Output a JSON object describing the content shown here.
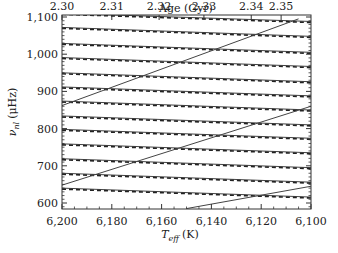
{
  "chart_data": {
    "type": "line",
    "title": "",
    "xlabel": "T_eff (K)",
    "xlabel_main": "T",
    "xlabel_sub": "eff",
    "xlabel_unit": "(K)",
    "ylabel": "ν_nl (μHz)",
    "ylabel_main": "ν",
    "ylabel_sub": "nl",
    "ylabel_unit": "(μHz)",
    "top_xlabel": "Age (Gyr)",
    "xlim": [
      6200,
      6100
    ],
    "ylim": [
      585,
      1110
    ],
    "x_ticks": [
      6200,
      6180,
      6160,
      6140,
      6120,
      6100
    ],
    "x_tick_labels": [
      "6,200",
      "6,180",
      "6,160",
      "6,140",
      "6,120",
      "6,100"
    ],
    "y_ticks": [
      600,
      700,
      800,
      900,
      1000,
      1100
    ],
    "y_tick_labels": [
      "600",
      "700",
      "800",
      "900",
      "1,000",
      "1,100"
    ],
    "top_ticks": [
      {
        "label": "2.30",
        "teff": 6200
      },
      {
        "label": "2.31",
        "teff": 6180
      },
      {
        "label": "2.32",
        "teff": 6161
      },
      {
        "label": "2.33",
        "teff": 6143
      },
      {
        "label": "2.34",
        "teff": 6124
      },
      {
        "label": "2.35",
        "teff": 6112
      }
    ],
    "grid": false,
    "legend": null,
    "series": [
      {
        "name": "radial modes (dashed)",
        "style": "dashed",
        "lines": [
          {
            "x": [
              6200,
              6100
            ],
            "y": [
              1110,
              1088
            ]
          },
          {
            "x": [
              6200,
              6100
            ],
            "y": [
              1072,
              1048
            ]
          },
          {
            "x": [
              6200,
              6100
            ],
            "y": [
              1029,
              1005
            ]
          },
          {
            "x": [
              6200,
              6100
            ],
            "y": [
              991,
              967
            ]
          },
          {
            "x": [
              6200,
              6100
            ],
            "y": [
              950,
              926
            ]
          },
          {
            "x": [
              6200,
              6100
            ],
            "y": [
              912,
              888
            ]
          },
          {
            "x": [
              6200,
              6100
            ],
            "y": [
              874,
              850
            ]
          },
          {
            "x": [
              6200,
              6100
            ],
            "y": [
              834,
              810
            ]
          },
          {
            "x": [
              6200,
              6100
            ],
            "y": [
              798,
              774
            ]
          },
          {
            "x": [
              6200,
              6100
            ],
            "y": [
              759,
              735
            ]
          },
          {
            "x": [
              6200,
              6100
            ],
            "y": [
              719,
              695
            ]
          },
          {
            "x": [
              6200,
              6100
            ],
            "y": [
              680,
              656
            ]
          },
          {
            "x": [
              6200,
              6100
            ],
            "y": [
              640,
              616
            ]
          }
        ]
      },
      {
        "name": "mixed modes (solid)",
        "style": "solid",
        "lines": [
          {
            "x": [
              6200,
              6105
            ],
            "y": [
              862,
              1095
            ]
          },
          {
            "x": [
              6200,
              6100
            ],
            "y": [
              648,
              860
            ]
          },
          {
            "x": [
              6150,
              6100
            ],
            "y": [
              585,
              645
            ]
          }
        ]
      }
    ]
  }
}
